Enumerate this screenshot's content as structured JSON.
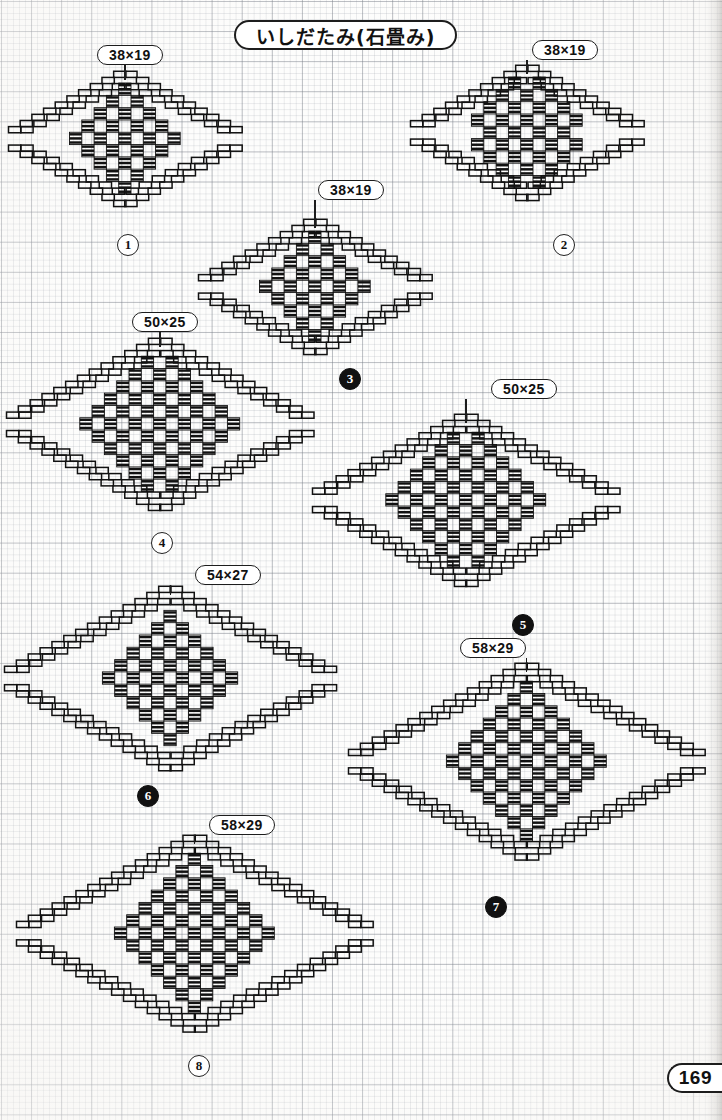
{
  "page": {
    "title": "いしだたみ(石畳み)",
    "page_number": "169",
    "paper": "graph-paper",
    "ink_color": "#111111"
  },
  "motifs": [
    {
      "id": "motif-1",
      "size_label": "38×19",
      "number": "1",
      "badge_style": "open",
      "cols": 38,
      "rows": 19,
      "cell": 6.15,
      "x": 8,
      "y": 80,
      "label_x": 97,
      "label_y": 45,
      "num_x": 117,
      "num_y": 234
    },
    {
      "id": "motif-2",
      "size_label": "38×19",
      "number": "2",
      "badge_style": "open",
      "cols": 38,
      "rows": 19,
      "cell": 6.15,
      "x": 410,
      "y": 74,
      "label_x": 532,
      "label_y": 40,
      "num_x": 553,
      "num_y": 234
    },
    {
      "id": "motif-3",
      "size_label": "38×19",
      "number": "3",
      "badge_style": "solid",
      "cols": 38,
      "rows": 19,
      "cell": 6.15,
      "x": 198,
      "y": 228,
      "label_x": 318,
      "label_y": 180,
      "num_x": 339,
      "num_y": 368
    },
    {
      "id": "motif-4",
      "size_label": "50×25",
      "number": "4",
      "badge_style": "open",
      "cols": 50,
      "rows": 25,
      "cell": 6.15,
      "x": 6,
      "y": 347,
      "label_x": 132,
      "label_y": 312,
      "num_x": 151,
      "num_y": 532
    },
    {
      "id": "motif-5",
      "size_label": "50×25",
      "number": "5",
      "badge_style": "solid",
      "cols": 50,
      "rows": 25,
      "cell": 6.15,
      "x": 312,
      "y": 423,
      "label_x": 491,
      "label_y": 379,
      "num_x": 512,
      "num_y": 614
    },
    {
      "id": "motif-6",
      "size_label": "54×27",
      "number": "6",
      "badge_style": "solid",
      "cols": 54,
      "rows": 27,
      "cell": 6.15,
      "x": 4,
      "y": 595,
      "label_x": 195,
      "label_y": 565,
      "num_x": 137,
      "num_y": 785
    },
    {
      "id": "motif-7",
      "size_label": "58×29",
      "number": "7",
      "badge_style": "solid",
      "cols": 58,
      "rows": 29,
      "cell": 6.15,
      "x": 348,
      "y": 672,
      "label_x": 460,
      "label_y": 638,
      "num_x": 485,
      "num_y": 896
    },
    {
      "id": "motif-8",
      "size_label": "58×29",
      "number": "8",
      "badge_style": "open",
      "cols": 58,
      "rows": 29,
      "cell": 6.15,
      "x": 16,
      "y": 844,
      "label_x": 209,
      "label_y": 815,
      "num_x": 188,
      "num_y": 1055
    }
  ]
}
